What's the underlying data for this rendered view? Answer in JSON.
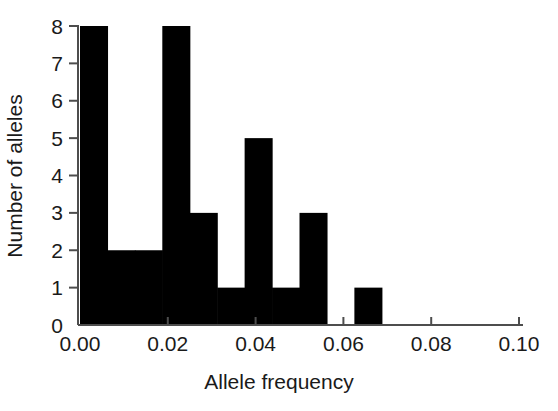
{
  "chart_data": {
    "type": "bar",
    "title": "",
    "subtitle": "",
    "xlabel": "Allele frequency",
    "ylabel": "Number of alleles",
    "xlim": [
      0.0,
      0.1
    ],
    "ylim": [
      0,
      8
    ],
    "xticks": [
      0.0,
      0.02,
      0.04,
      0.06,
      0.08,
      0.1
    ],
    "xticklabels": [
      "0.00",
      "0.02",
      "0.04",
      "0.06",
      "0.08",
      "0.10"
    ],
    "yticks": [
      0,
      1,
      2,
      3,
      4,
      5,
      6,
      7,
      8
    ],
    "yticklabels": [
      "0",
      "1",
      "2",
      "3",
      "4",
      "5",
      "6",
      "7",
      "8"
    ],
    "grid": false,
    "legend": null,
    "bar_color": "#000000",
    "axis_color": "#4d4d4d",
    "bin_width": 0.00625,
    "bin_edges": [
      0.0,
      0.00625,
      0.0125,
      0.01875,
      0.025,
      0.03125,
      0.0375,
      0.04375,
      0.05,
      0.05625,
      0.0625,
      0.06875,
      0.075,
      0.08125,
      0.0875,
      0.09375,
      0.1
    ],
    "categories": [
      "0.000-0.006",
      "0.006-0.013",
      "0.013-0.019",
      "0.019-0.025",
      "0.025-0.031",
      "0.031-0.038",
      "0.038-0.044",
      "0.044-0.050",
      "0.050-0.056",
      "0.056-0.063",
      "0.063-0.069",
      "0.069-0.075",
      "0.075-0.081",
      "0.081-0.088",
      "0.088-0.094",
      "0.094-0.100"
    ],
    "values": [
      8,
      2,
      2,
      8,
      3,
      1,
      5,
      1,
      3,
      0,
      1,
      0,
      0,
      0,
      0,
      0
    ],
    "bars": [
      {
        "x0": 0.0,
        "x1": 0.00625,
        "value": 8
      },
      {
        "x0": 0.00625,
        "x1": 0.0125,
        "value": 2
      },
      {
        "x0": 0.0125,
        "x1": 0.01875,
        "value": 2
      },
      {
        "x0": 0.01875,
        "x1": 0.025,
        "value": 8
      },
      {
        "x0": 0.025,
        "x1": 0.03125,
        "value": 3
      },
      {
        "x0": 0.03125,
        "x1": 0.0375,
        "value": 1
      },
      {
        "x0": 0.0375,
        "x1": 0.04375,
        "value": 5
      },
      {
        "x0": 0.04375,
        "x1": 0.05,
        "value": 1
      },
      {
        "x0": 0.05,
        "x1": 0.05625,
        "value": 3
      },
      {
        "x0": 0.05625,
        "x1": 0.0625,
        "value": 0
      },
      {
        "x0": 0.0625,
        "x1": 0.06875,
        "value": 1
      },
      {
        "x0": 0.06875,
        "x1": 0.075,
        "value": 0
      },
      {
        "x0": 0.075,
        "x1": 0.08125,
        "value": 0
      },
      {
        "x0": 0.08125,
        "x1": 0.0875,
        "value": 0
      },
      {
        "x0": 0.0875,
        "x1": 0.09375,
        "value": 0
      },
      {
        "x0": 0.09375,
        "x1": 0.1,
        "value": 0
      }
    ]
  }
}
